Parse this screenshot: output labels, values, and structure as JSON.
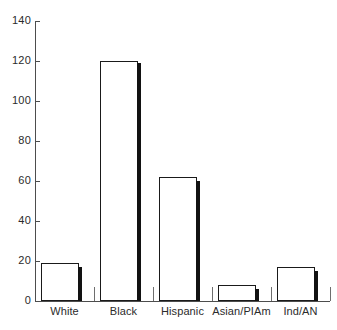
{
  "chart_data": {
    "type": "bar",
    "title": "",
    "subtitle": "",
    "xlabel": "",
    "ylabel": "",
    "categories": [
      "White",
      "Black",
      "Hispanic",
      "Asian/PIAm",
      "Ind/AN"
    ],
    "series": [
      {
        "name": "open",
        "style": "open-outline",
        "values": [
          19,
          120,
          62,
          8,
          17
        ]
      },
      {
        "name": "solid",
        "style": "solid-black",
        "values": [
          17,
          119,
          60,
          6,
          15
        ]
      }
    ],
    "ylim": [
      0,
      140
    ],
    "yticks": [
      0,
      20,
      40,
      60,
      80,
      100,
      120,
      140
    ],
    "ytick_labels": [
      "0",
      "20",
      "40",
      "60",
      "80",
      "100",
      "120",
      "140"
    ],
    "grid": false,
    "legend": null,
    "legend_position": "none",
    "annotations": []
  },
  "colors": {
    "axis": "#4d4d4d",
    "bar_outline": "#1a1a1a",
    "bar_open_fill": "#ffffff",
    "bar_solid_fill": "#121212",
    "text": "#2b2b2b",
    "background": "#ffffff",
    "separator": "#6e6e6e"
  }
}
